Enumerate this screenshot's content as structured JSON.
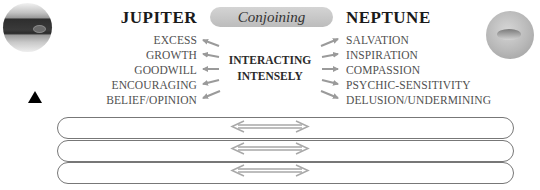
{
  "left_planet": {
    "name": "JUPITER",
    "image_icon": "jupiter-planet-icon",
    "keywords": [
      "EXCESS",
      "GROWTH",
      "GOODWILL",
      "ENCOURAGING",
      "BELIEF/OPINION"
    ]
  },
  "right_planet": {
    "name": "NEPTUNE",
    "image_icon": "neptune-planet-icon",
    "keywords": [
      "SALVATION",
      "INSPIRATION",
      "COMPASSION",
      "PSYCHIC-SENSITIVITY",
      "DELUSION/UNDERMINING"
    ]
  },
  "aspect": {
    "label": "Conjoining",
    "symbol_icon": "triangle-up-icon"
  },
  "interaction": {
    "line1": "INTERACTING",
    "line2": "INTENSELY"
  },
  "bars": [
    {
      "arrow_icon": "double-arrow-icon"
    },
    {
      "arrow_icon": "double-arrow-icon"
    },
    {
      "arrow_icon": "double-arrow-icon"
    }
  ],
  "colors": {
    "pill_fill": "#c8c8c8",
    "arrow": "#9a9a9a",
    "text_dark": "#1a1a1a",
    "text_keyword": "#505050"
  }
}
